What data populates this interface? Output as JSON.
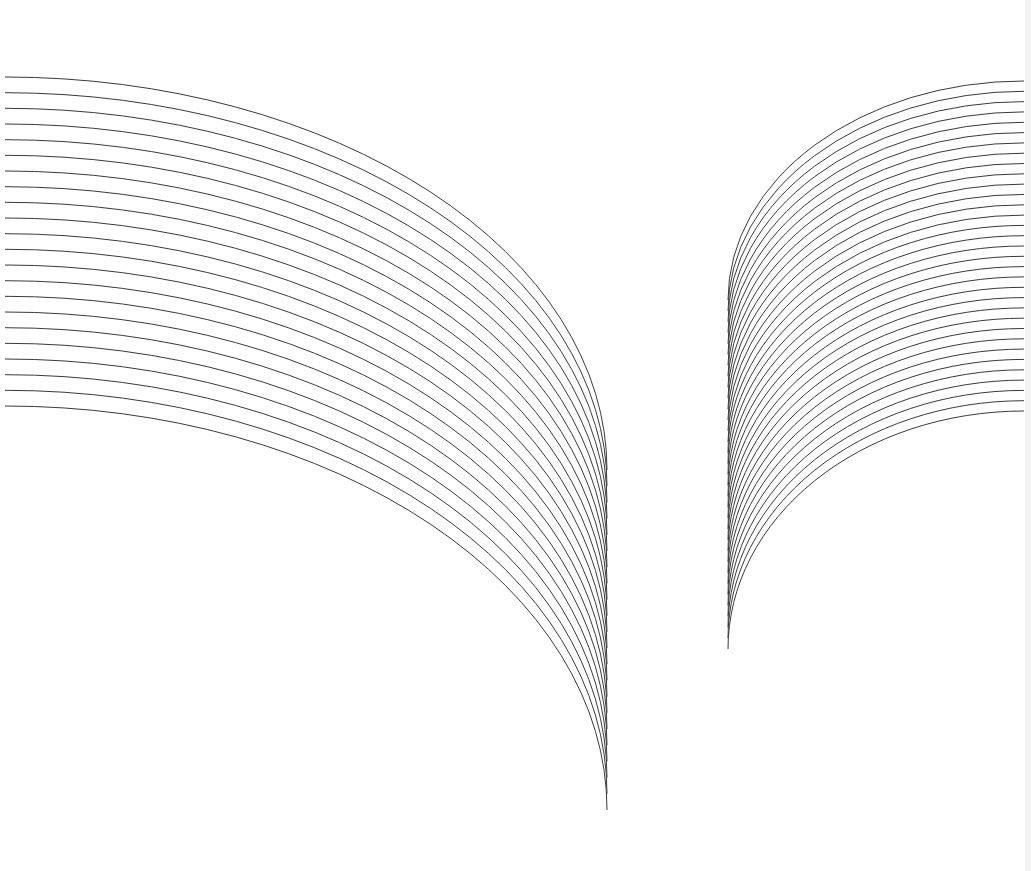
{
  "canvas": {
    "width": 1031,
    "height": 871,
    "background": "#ffffff"
  },
  "style": {
    "stroke": "#3a3a3a",
    "stroke_width": 1
  },
  "fans": [
    {
      "name": "left-fan",
      "count": 22,
      "anchor_x": 5,
      "converge_x": 607,
      "start_y_first": 77,
      "start_y_last": 406,
      "end_y_first": 470,
      "end_y_last": 810
    },
    {
      "name": "right-fan",
      "count": 33,
      "anchor_x": 1024,
      "converge_x": 728,
      "start_y_first": 81,
      "start_y_last": 411,
      "end_y_first": 300,
      "end_y_last": 649
    }
  ]
}
